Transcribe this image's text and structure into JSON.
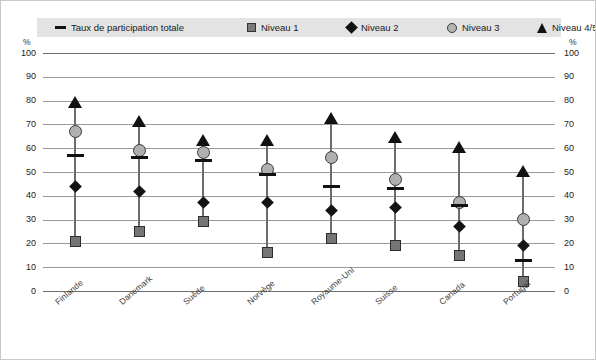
{
  "axis": {
    "unit_left": "%",
    "unit_right": "%",
    "ticks": [
      "100",
      "90",
      "80",
      "70",
      "60",
      "50",
      "40",
      "30",
      "20",
      "10",
      "0"
    ]
  },
  "legend": {
    "items": [
      {
        "label": "Taux de participation totale",
        "marker": "dash"
      },
      {
        "label": "Niveau 1",
        "marker": "square"
      },
      {
        "label": "Niveau 2",
        "marker": "diamond"
      },
      {
        "label": "Niveau 3",
        "marker": "circle"
      },
      {
        "label": "Niveau 4/5",
        "marker": "triangle"
      }
    ]
  },
  "chart_data": {
    "type": "scatter",
    "title": "",
    "xlabel": "",
    "ylabel": "%",
    "ylim": [
      0,
      100
    ],
    "ytick_step": 10,
    "grid": true,
    "legend_position": "top",
    "categories": [
      "Finlande",
      "Danemark",
      "Suède",
      "Norvège",
      "Royaume-Uni",
      "Suisse",
      "Canada",
      "Portugal"
    ],
    "series": [
      {
        "name": "Taux de participation totale",
        "marker": "dash",
        "color": "#111111",
        "values": [
          57,
          56,
          55,
          49,
          44,
          43,
          36,
          13
        ]
      },
      {
        "name": "Niveau 1",
        "marker": "square",
        "color": "#757575",
        "values": [
          21,
          25,
          29,
          16,
          22,
          19,
          15,
          4
        ]
      },
      {
        "name": "Niveau 2",
        "marker": "diamond",
        "color": "#141414",
        "values": [
          44,
          42,
          37,
          37,
          34,
          35,
          27,
          19
        ]
      },
      {
        "name": "Niveau 3",
        "marker": "circle",
        "color": "#b0b0b0",
        "values": [
          67,
          59,
          58,
          51,
          56,
          47,
          37,
          30
        ]
      },
      {
        "name": "Niveau 4/5",
        "marker": "triangle",
        "color": "#111111",
        "values": [
          77,
          69,
          61,
          61,
          70,
          62,
          58,
          48
        ]
      }
    ]
  }
}
